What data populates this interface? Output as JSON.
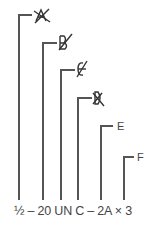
{
  "diagram": {
    "line_color": "#555555",
    "callout_text": "½ – 20 UN C – 2A × 3",
    "callout_parts": [
      "½",
      "20",
      "UN",
      "C",
      "2A",
      "3"
    ],
    "leaders": [
      {
        "x": 19,
        "top": 15,
        "end": 32,
        "marker": "crossed-out-A",
        "label": ""
      },
      {
        "x": 43,
        "top": 43,
        "end": 57,
        "marker": "crossed-out-B",
        "label": ""
      },
      {
        "x": 61,
        "top": 70,
        "end": 75,
        "marker": "crossed-out-C",
        "label": ""
      },
      {
        "x": 78,
        "top": 98,
        "end": 92,
        "marker": "crossed-out-D",
        "label": ""
      },
      {
        "x": 101,
        "top": 126,
        "end": 113,
        "marker": "",
        "label": "E"
      },
      {
        "x": 124,
        "top": 157,
        "end": 134,
        "marker": "",
        "label": "F"
      }
    ],
    "labels": {
      "e": "E",
      "f": "F"
    }
  }
}
